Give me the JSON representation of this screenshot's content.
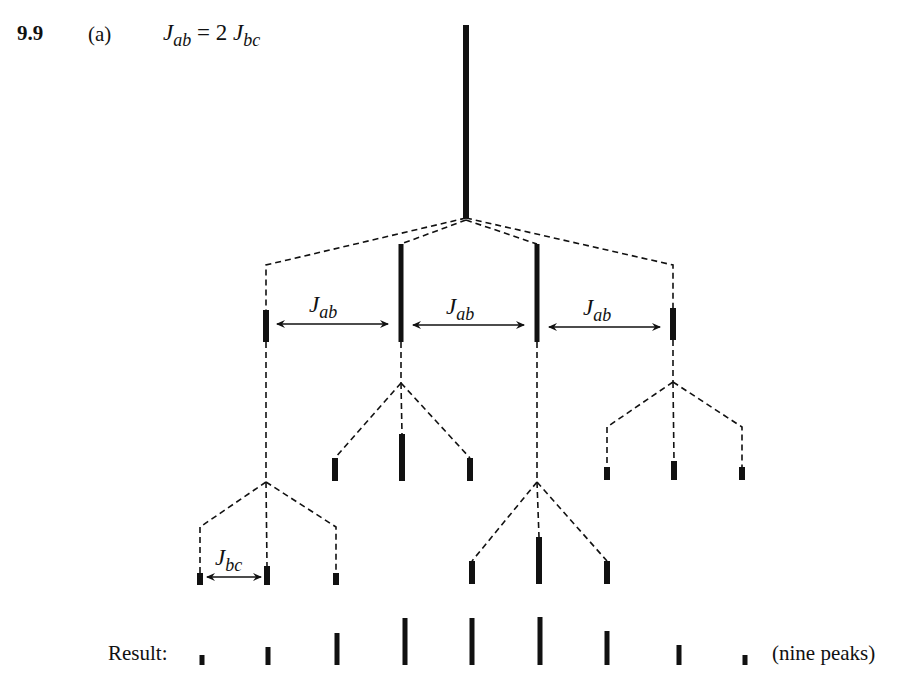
{
  "header": {
    "problem_number": "9.9",
    "part": "(a)",
    "equation": {
      "lhs_symbol": "J",
      "lhs_sub": "ab",
      "op": " = 2 ",
      "rhs_symbol": "J",
      "rhs_sub": "bc"
    }
  },
  "coupling_labels": {
    "jab": [
      {
        "symbol": "J",
        "sub": "ab"
      },
      {
        "symbol": "J",
        "sub": "ab"
      },
      {
        "symbol": "J",
        "sub": "ab"
      }
    ],
    "jbc": {
      "symbol": "J",
      "sub": "bc"
    }
  },
  "tree": {
    "root": {
      "x": 466,
      "top": 25,
      "bottom": 218
    },
    "level1": [
      {
        "x": 266,
        "top": 310,
        "bottom": 342
      },
      {
        "x": 401,
        "top": 244,
        "bottom": 342
      },
      {
        "x": 537,
        "top": 244,
        "bottom": 342
      },
      {
        "x": 673,
        "top": 308,
        "bottom": 340
      }
    ],
    "level2_groups": [
      {
        "parent": 1,
        "apex_y": 383,
        "peaks": [
          {
            "x": 335,
            "top": 458,
            "bottom": 481
          },
          {
            "x": 402,
            "top": 434,
            "bottom": 481
          },
          {
            "x": 470,
            "top": 458,
            "bottom": 481
          }
        ]
      },
      {
        "parent": 3,
        "apex_y": 382,
        "peaks": [
          {
            "x": 607,
            "top": 467,
            "bottom": 480
          },
          {
            "x": 674,
            "top": 461,
            "bottom": 480
          },
          {
            "x": 742,
            "top": 467,
            "bottom": 480
          }
        ]
      },
      {
        "parent": 0,
        "apex_y": 482,
        "peaks": [
          {
            "x": 200,
            "top": 573,
            "bottom": 585
          },
          {
            "x": 267,
            "top": 566,
            "bottom": 585
          },
          {
            "x": 336,
            "top": 573,
            "bottom": 585
          }
        ]
      },
      {
        "parent": 2,
        "apex_y": 482,
        "peaks": [
          {
            "x": 472,
            "top": 561,
            "bottom": 584
          },
          {
            "x": 539,
            "top": 537,
            "bottom": 584
          },
          {
            "x": 607,
            "top": 561,
            "bottom": 584
          }
        ]
      }
    ]
  },
  "result": {
    "label": "Result:",
    "note": "(nine peaks)",
    "peaks": [
      {
        "x": 202,
        "height": 10
      },
      {
        "x": 268,
        "height": 18
      },
      {
        "x": 337,
        "height": 32
      },
      {
        "x": 405,
        "height": 47
      },
      {
        "x": 472,
        "height": 47
      },
      {
        "x": 540,
        "height": 48
      },
      {
        "x": 607,
        "height": 34
      },
      {
        "x": 679,
        "height": 20
      },
      {
        "x": 745,
        "height": 10
      }
    ],
    "baseline_y": 665
  }
}
